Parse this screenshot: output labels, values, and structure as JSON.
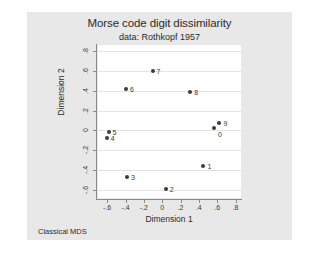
{
  "chart_data": {
    "type": "scatter",
    "title": "Morse code digit dissimilarity",
    "subtitle": "data: Rothkopf 1957",
    "xlabel": "Dimension 1",
    "ylabel": "Dimension 2",
    "note": "Classical MDS",
    "xlim": [
      -0.7,
      0.86
    ],
    "ylim": [
      -0.68,
      0.86
    ],
    "xticks": [
      "-.6",
      "-.4",
      "-.2",
      "0",
      ".2",
      ".4",
      ".6",
      ".8"
    ],
    "xtickvalues": [
      -0.6,
      -0.4,
      -0.2,
      0,
      0.2,
      0.4,
      0.6,
      0.8
    ],
    "yticks": [
      "-.6",
      "-.4",
      "-.2",
      "0",
      ".2",
      ".4",
      ".6",
      ".8"
    ],
    "ytickvalues": [
      -0.6,
      -0.4,
      -0.2,
      0,
      0.2,
      0.4,
      0.6,
      0.8
    ],
    "grid": "horizontal",
    "legend": "none",
    "marker_color": "#3c3c3c",
    "points": [
      {
        "label": "7",
        "x": -0.105,
        "y": 0.595,
        "lx": 4,
        "ly": 0
      },
      {
        "label": "6",
        "x": -0.395,
        "y": 0.415,
        "lx": 4,
        "ly": 0
      },
      {
        "label": "8",
        "x": 0.305,
        "y": 0.385,
        "lx": 4,
        "ly": 0
      },
      {
        "label": "9",
        "x": 0.625,
        "y": 0.07,
        "lx": 4,
        "ly": 0
      },
      {
        "label": "0",
        "x": 0.565,
        "y": 0.02,
        "lx": 4,
        "ly": 6
      },
      {
        "label": "5",
        "x": -0.585,
        "y": -0.015,
        "lx": 4,
        "ly": 0
      },
      {
        "label": "4",
        "x": -0.605,
        "y": -0.08,
        "lx": 4,
        "ly": 0
      },
      {
        "label": "1",
        "x": 0.45,
        "y": -0.355,
        "lx": 4,
        "ly": 0
      },
      {
        "label": "3",
        "x": -0.385,
        "y": -0.47,
        "lx": 4,
        "ly": 0
      },
      {
        "label": "2",
        "x": 0.04,
        "y": -0.585,
        "lx": 4,
        "ly": 0
      }
    ]
  }
}
